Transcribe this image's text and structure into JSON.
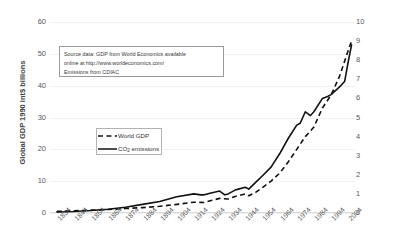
{
  "chart_data": {
    "type": "line",
    "title": "",
    "xlabel": "",
    "ylabel": "Global GDP 1990 int$ billions",
    "y2label": "CO2 emissions PgC",
    "xlim": [
      1830,
      2008
    ],
    "ylim": [
      0,
      60
    ],
    "y2lim": [
      0,
      10
    ],
    "grid": true,
    "legend_position": "center-left",
    "x_tick_labels": [
      "1834",
      "1844",
      "1854",
      "1864",
      "1874",
      "1884",
      "1894",
      "1904",
      "1914",
      "1924",
      "1934",
      "1944",
      "1954",
      "1964",
      "1974",
      "1984",
      "1994",
      "2004"
    ],
    "y_left_tick_labels": [
      "0",
      "10",
      "20",
      "30",
      "40",
      "50",
      "60"
    ],
    "y_right_tick_labels": [
      "0",
      "1",
      "2",
      "3",
      "4",
      "5",
      "6",
      "7",
      "8",
      "9",
      "10"
    ],
    "annotation": {
      "line1": "Source data: GDP from World Economics available",
      "line2": "online  at http://www.worldeconomics.com/",
      "line3": "Emissions from CDIAC"
    },
    "legend": [
      {
        "name": "World GDP",
        "style": "dashed",
        "color": "#111111",
        "axis": "left"
      },
      {
        "name": "CO2 emissions",
        "style": "solid",
        "color": "#111111",
        "axis": "right"
      }
    ],
    "series": [
      {
        "name": "World GDP",
        "style": "dashed",
        "axis": "left",
        "x": [
          1834,
          1844,
          1854,
          1864,
          1874,
          1884,
          1894,
          1904,
          1914,
          1920,
          1924,
          1929,
          1934,
          1938,
          1944,
          1946,
          1950,
          1954,
          1959,
          1964,
          1969,
          1974,
          1979,
          1984,
          1989,
          1994,
          1999,
          2004,
          2006
        ],
        "values": [
          0.5,
          0.7,
          0.9,
          1.1,
          1.4,
          1.7,
          2.1,
          2.7,
          3.4,
          3.3,
          3.9,
          4.6,
          4.4,
          5.2,
          6.0,
          5.4,
          6.5,
          8.0,
          10.0,
          12.5,
          16.0,
          20.0,
          24.0,
          27.0,
          33.0,
          37.0,
          43.0,
          51.0,
          54.0
        ]
      },
      {
        "name": "CO2 emissions",
        "style": "solid",
        "axis": "right",
        "x": [
          1834,
          1844,
          1854,
          1864,
          1874,
          1884,
          1894,
          1904,
          1914,
          1918,
          1920,
          1924,
          1929,
          1932,
          1934,
          1938,
          1940,
          1944,
          1946,
          1950,
          1954,
          1959,
          1964,
          1969,
          1974,
          1976,
          1979,
          1982,
          1984,
          1989,
          1992,
          1994,
          1999,
          2002,
          2004,
          2006
        ],
        "values": [
          0.05,
          0.08,
          0.13,
          0.2,
          0.3,
          0.45,
          0.6,
          0.85,
          1.0,
          0.95,
          0.95,
          1.05,
          1.15,
          0.95,
          1.0,
          1.2,
          1.25,
          1.35,
          1.25,
          1.6,
          1.95,
          2.4,
          3.1,
          3.9,
          4.6,
          4.7,
          5.3,
          5.1,
          5.3,
          6.0,
          6.1,
          6.2,
          6.6,
          6.9,
          7.9,
          8.8
        ]
      }
    ]
  }
}
